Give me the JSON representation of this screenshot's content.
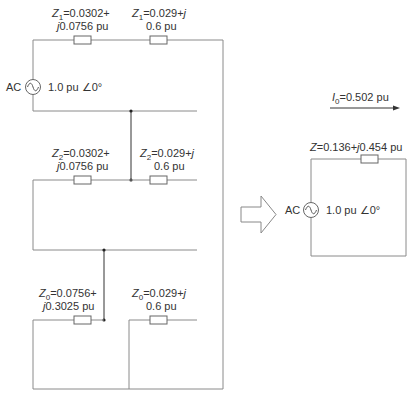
{
  "figure": {
    "left_network": {
      "source": {
        "label": "AC",
        "value": "1.0 pu ∠0°"
      },
      "positive_sequence": {
        "z_left": {
          "symbol": "Z",
          "subscript": "1",
          "line1": "=0.0302+",
          "line2_j": "j",
          "line2": "0.0756 pu"
        },
        "z_right": {
          "symbol": "Z",
          "subscript": "1",
          "line1": "=0.029+",
          "line1_j": "j",
          "line2": "0.6 pu"
        }
      },
      "negative_sequence": {
        "z_left": {
          "symbol": "Z",
          "subscript": "2",
          "line1": "=0.0302+",
          "line2_j": "j",
          "line2": "0.0756 pu"
        },
        "z_right": {
          "symbol": "Z",
          "subscript": "2",
          "line1": "=0.029+",
          "line1_j": "j",
          "line2": "0.6 pu"
        }
      },
      "zero_sequence": {
        "z_left": {
          "symbol": "Z",
          "subscript": "0",
          "line1": "=0.0756+",
          "line2_j": "j",
          "line2": "0.3025 pu"
        },
        "z_right": {
          "symbol": "Z",
          "subscript": "0",
          "line1": "=0.029+",
          "line1_j": "j",
          "line2": "0.6 pu"
        }
      }
    },
    "equivalent_circuit": {
      "current": {
        "symbol": "I",
        "subscript": "0",
        "value": "=0.502 pu"
      },
      "impedance": {
        "symbol": "Z",
        "prefix": "=0.136+",
        "j": "j",
        "suffix": "0.454 pu"
      },
      "source": {
        "label": "AC",
        "value": "1.0 pu ∠0°"
      }
    },
    "colors": {
      "wire": "#8a8a8a",
      "text": "#333333",
      "background": "#ffffff"
    }
  }
}
